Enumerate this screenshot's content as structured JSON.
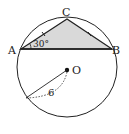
{
  "figure": {
    "points": {
      "A": {
        "label": "A",
        "x": 21,
        "y": 49
      },
      "B": {
        "label": "B",
        "x": 112,
        "y": 49
      },
      "C": {
        "label": "C",
        "x": 67,
        "y": 19
      },
      "O": {
        "label": "O",
        "x": 67,
        "y": 70
      }
    },
    "circle": {
      "cx": 67,
      "cy": 67,
      "r": 50
    },
    "angle_label": "30°",
    "radius_label": "6",
    "colors": {
      "stroke": "#222222",
      "fill": "#d9d9d9"
    }
  }
}
